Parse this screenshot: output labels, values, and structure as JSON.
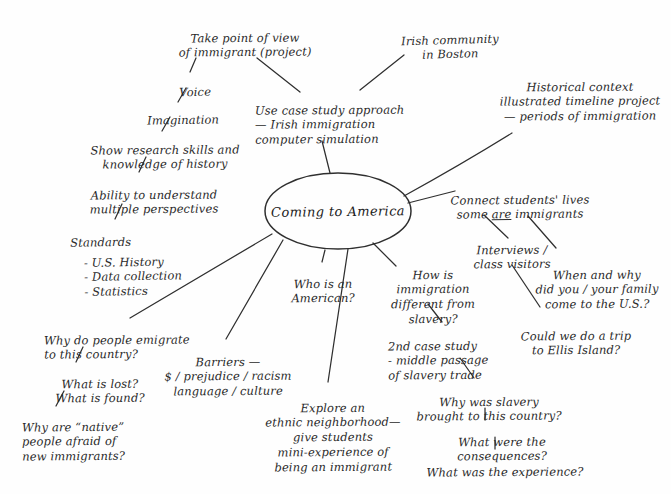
{
  "diagram": {
    "title": "Coming to America",
    "type": "hand-drawn mind map",
    "ink_color": "#2a2a2a",
    "paper_color": "#fefefe",
    "center": {
      "label": "Coming to America"
    },
    "nodes": [
      {
        "id": "take_pov",
        "label": "Take point of view\nof immigrant (project)"
      },
      {
        "id": "voice",
        "label": "Voice"
      },
      {
        "id": "imagination",
        "label": "Imagination"
      },
      {
        "id": "show_research",
        "label": "Show research skills and\nknowledge of history"
      },
      {
        "id": "ability",
        "label": "Ability to understand\nmultiple perspectives"
      },
      {
        "id": "standards",
        "label": "Standards"
      },
      {
        "id": "standards_items",
        "label": "- U.S. History\n- Data collection\n- Statistics"
      },
      {
        "id": "case_study",
        "label": "Use case study approach\n— Irish immigration\n      computer simulation"
      },
      {
        "id": "irish_boston",
        "label": "Irish community\nin Boston"
      },
      {
        "id": "historical",
        "label": "Historical context\nillustrated timeline project\n— periods of immigration"
      },
      {
        "id": "connect",
        "label_pre": "Connect students' lives\nsome ",
        "label_ul": "are",
        "label_post": " immigrants"
      },
      {
        "id": "interviews",
        "label": "Interviews /\nclass visitors"
      },
      {
        "id": "when_why",
        "label": "When and why\ndid you / your family\ncome to the U.S.?"
      },
      {
        "id": "ellis",
        "label": "Could we do a trip\nto Ellis Island?"
      },
      {
        "id": "who_american",
        "label": "Who is an\nAmerican?"
      },
      {
        "id": "how_diff",
        "label": "How is\nimmigration\ndifferent from\nslavery?"
      },
      {
        "id": "second_case",
        "label": "2nd case study\n- middle passage\nof slavery trade"
      },
      {
        "id": "why_slavery",
        "label": "Why was slavery\nbrought to this country?"
      },
      {
        "id": "consequences",
        "label": "What were the consequences?"
      },
      {
        "id": "experience",
        "label": "What was the experience?"
      },
      {
        "id": "explore",
        "label": "Explore an\nethnic neighborhood—\ngive students\nmini-experience of\nbeing an immigrant"
      },
      {
        "id": "barriers",
        "label": "Barriers —\n$ / prejudice / racism\nlanguage / culture"
      },
      {
        "id": "why_emigrate",
        "label": "Why do people emigrate\n   to this country?"
      },
      {
        "id": "lost_found",
        "label": "What is lost?\nWhat is found?"
      },
      {
        "id": "native",
        "label": "Why are “native”\npeople afraid of\nnew immigrants?"
      }
    ]
  }
}
